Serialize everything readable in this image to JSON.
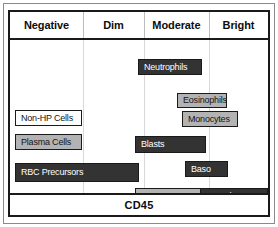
{
  "figure": {
    "axis_label": "CD45",
    "axis_title": "CD45",
    "columns": [
      {
        "label": "Negative",
        "left_pct": 0,
        "width_pct": 28.3
      },
      {
        "label": "Dim",
        "left_pct": 28.3,
        "width_pct": 23.6
      },
      {
        "label": "Moderate",
        "left_pct": 51.9,
        "width_pct": 25.2
      },
      {
        "label": "Bright",
        "left_pct": 77.1,
        "width_pct": 22.9
      }
    ],
    "colors": {
      "dark": "#333333",
      "gray": "#b3b3b3",
      "white": "#ffffff",
      "border": "#1a1a1a",
      "divider": "#d8d8d8",
      "frame": "#8a8a8a"
    },
    "populations": [
      {
        "label": "Neutrophils",
        "fill": "dark",
        "x": 128,
        "y": 19,
        "w": 64,
        "h": 16,
        "align": "left"
      },
      {
        "label": "Eosinophils",
        "fill": "gray",
        "x": 167,
        "y": 53,
        "w": 50,
        "h": 15,
        "align": "left"
      },
      {
        "label": "Monocytes",
        "fill": "gray",
        "x": 172,
        "y": 71,
        "w": 56,
        "h": 16,
        "align": "left"
      },
      {
        "label": "Non-HP Cells",
        "fill": "white",
        "x": 5,
        "y": 70,
        "w": 67,
        "h": 16,
        "align": "left"
      },
      {
        "label": "Plasma Cells",
        "fill": "gray",
        "x": 5,
        "y": 94,
        "w": 67,
        "h": 16,
        "align": "left"
      },
      {
        "label": "Blasts",
        "fill": "dark",
        "x": 125,
        "y": 96,
        "w": 71,
        "h": 17,
        "align": "left"
      },
      {
        "label": "Baso",
        "fill": "dark",
        "x": 175,
        "y": 121,
        "w": 43,
        "h": 16,
        "align": "left"
      },
      {
        "label": "RBC Precursors",
        "fill": "dark",
        "x": 5,
        "y": 123,
        "w": 124,
        "h": 19,
        "align": "left"
      },
      {
        "label": "Hematogones",
        "fill": "gray",
        "x": 125,
        "y": 148,
        "w": 66,
        "h": 17,
        "align": "center"
      },
      {
        "label": "Lymphocytes",
        "fill": "dark",
        "x": 190,
        "y": 148,
        "w": 68,
        "h": 17,
        "align": "center"
      }
    ]
  },
  "chart_data": {
    "type": "bar",
    "title": "",
    "xlabel": "CD45",
    "ylabel": "",
    "categories": [
      "Negative",
      "Dim",
      "Moderate",
      "Bright"
    ],
    "grid": true,
    "legend": "none",
    "orientation": "horizontal-ranges",
    "series": [
      {
        "name": "Non-HP Cells",
        "range": [
          "Negative",
          "Negative"
        ],
        "shade": "white"
      },
      {
        "name": "Plasma Cells",
        "range": [
          "Negative",
          "Negative"
        ],
        "shade": "light-gray"
      },
      {
        "name": "RBC Precursors",
        "range": [
          "Negative",
          "Dim"
        ],
        "shade": "dark"
      },
      {
        "name": "Neutrophils",
        "range": [
          "Moderate",
          "Moderate"
        ],
        "shade": "dark"
      },
      {
        "name": "Blasts",
        "range": [
          "Moderate",
          "Bright"
        ],
        "shade": "dark"
      },
      {
        "name": "Hematogones",
        "range": [
          "Moderate",
          "Moderate"
        ],
        "shade": "light-gray"
      },
      {
        "name": "Eosinophils",
        "range": [
          "Bright",
          "Bright"
        ],
        "shade": "light-gray"
      },
      {
        "name": "Monocytes",
        "range": [
          "Bright",
          "Bright"
        ],
        "shade": "light-gray"
      },
      {
        "name": "Baso",
        "range": [
          "Bright",
          "Bright"
        ],
        "shade": "dark"
      },
      {
        "name": "Lymphocytes",
        "range": [
          "Bright",
          "Bright"
        ],
        "shade": "dark"
      }
    ]
  }
}
